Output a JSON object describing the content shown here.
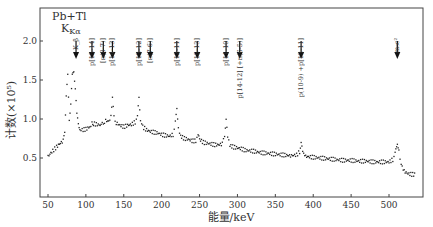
{
  "chart_data": {
    "type": "scatter",
    "title": "Pb+Tl",
    "xlabel": "能量/keV",
    "ylabel": "计数(×10⁵)",
    "xlim": [
      40,
      545
    ],
    "ylim": [
      0,
      2.4
    ],
    "x_ticks": [
      50,
      100,
      150,
      200,
      250,
      300,
      350,
      400,
      450,
      500
    ],
    "y_ticks": [
      0.5,
      1.0,
      1.5,
      2.0
    ],
    "grid": false,
    "annotations": [
      {
        "label": "Pb+Tl",
        "sub": "Kα",
        "energy": 75
      },
      {
        "label": "K_β",
        "energy": 87
      },
      {
        "label": "p[15-14]",
        "energy": 108
      },
      {
        "label": "[π(8-7)]",
        "energy": 123
      },
      {
        "label": "p[14-13]",
        "energy": 135
      },
      {
        "label": "p[13-12]",
        "energy": 170
      },
      {
        "label": "[π(7-6)]",
        "energy": 185
      },
      {
        "label": "p[12-11]",
        "energy": 220
      },
      {
        "label": "p[15-13]",
        "energy": 247
      },
      {
        "label": "p[11-10]",
        "energy": 285
      },
      {
        "label": "p[14-12] [+π(6-5)]",
        "energy": 303
      },
      {
        "label": "p(10-9) +p[13-11]",
        "energy": 384
      },
      {
        "label": "m₀c²",
        "energy": 511
      }
    ],
    "series": [
      {
        "name": "spectrum",
        "x": [
          50,
          55,
          60,
          65,
          70,
          72,
          74,
          76,
          78,
          80,
          82,
          84,
          86,
          88,
          90,
          92,
          95,
          100,
          105,
          108,
          110,
          115,
          120,
          123,
          126,
          130,
          133,
          135,
          137,
          140,
          145,
          150,
          155,
          160,
          165,
          168,
          170,
          172,
          175,
          180,
          185,
          190,
          195,
          200,
          205,
          210,
          215,
          218,
          220,
          222,
          225,
          230,
          235,
          240,
          245,
          248,
          250,
          255,
          260,
          265,
          270,
          275,
          280,
          283,
          285,
          287,
          290,
          295,
          300,
          305,
          310,
          320,
          330,
          340,
          350,
          360,
          370,
          378,
          382,
          384,
          386,
          390,
          400,
          410,
          420,
          430,
          440,
          450,
          460,
          470,
          480,
          490,
          500,
          505,
          508,
          510,
          511,
          513,
          516,
          520,
          525,
          530,
          535
        ],
        "values": [
          0.52,
          0.58,
          0.63,
          0.68,
          0.72,
          0.85,
          1.3,
          1.55,
          1.0,
          1.2,
          1.55,
          1.62,
          1.4,
          1.05,
          0.95,
          0.88,
          0.86,
          0.87,
          0.9,
          0.96,
          0.94,
          0.93,
          0.92,
          0.95,
          0.98,
          0.97,
          1.05,
          1.3,
          1.02,
          0.95,
          0.92,
          0.9,
          0.92,
          0.93,
          0.96,
          1.02,
          1.28,
          1.0,
          0.9,
          0.86,
          0.84,
          0.83,
          0.82,
          0.8,
          0.79,
          0.78,
          0.8,
          0.95,
          1.15,
          0.9,
          0.78,
          0.75,
          0.74,
          0.72,
          0.72,
          0.78,
          0.74,
          0.7,
          0.69,
          0.68,
          0.67,
          0.67,
          0.68,
          0.8,
          0.98,
          0.76,
          0.66,
          0.64,
          0.63,
          0.62,
          0.6,
          0.59,
          0.57,
          0.56,
          0.55,
          0.54,
          0.53,
          0.54,
          0.58,
          0.68,
          0.58,
          0.52,
          0.51,
          0.5,
          0.49,
          0.48,
          0.47,
          0.47,
          0.46,
          0.46,
          0.45,
          0.45,
          0.45,
          0.48,
          0.55,
          0.65,
          0.7,
          0.6,
          0.42,
          0.33,
          0.3,
          0.29,
          0.29
        ]
      }
    ]
  }
}
